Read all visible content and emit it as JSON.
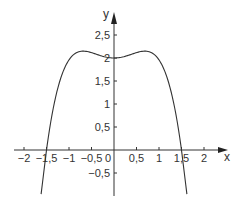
{
  "chart_data": {
    "type": "line",
    "title": "",
    "xlabel": "x",
    "ylabel": "y",
    "xlim": [
      -2.45,
      2.5
    ],
    "ylim": [
      -1.0,
      3.0
    ],
    "grid": false,
    "legend": "none",
    "origin_label": "0",
    "x_ticks": [
      {
        "value": -2,
        "label": "−2"
      },
      {
        "value": -1.5,
        "label": "−1,5"
      },
      {
        "value": -1,
        "label": "−1"
      },
      {
        "value": -0.5,
        "label": "−0,5"
      },
      {
        "value": 0.5,
        "label": "0,5"
      },
      {
        "value": 1,
        "label": "1"
      },
      {
        "value": 1.5,
        "label": "1,5"
      },
      {
        "value": 2,
        "label": "2"
      }
    ],
    "y_ticks": [
      {
        "value": 2.5,
        "label": "2,5"
      },
      {
        "value": 2,
        "label": "2"
      },
      {
        "value": 1.5,
        "label": "1,5"
      },
      {
        "value": 1,
        "label": "1"
      },
      {
        "value": 0.5,
        "label": "0,5"
      },
      {
        "value": -0.5,
        "label": "−0,5"
      }
    ],
    "series": [
      {
        "name": "f(x)",
        "description": "quartic curve, local minimum at (0, 2), maxima near (±0.69, 2.15), roots at ±1.5",
        "x_domain": [
          -1.62,
          1.62
        ],
        "x": [
          -1.62,
          -1.5,
          -1.4,
          -1.3,
          -1.2,
          -1.1,
          -1.0,
          -0.9,
          -0.8,
          -0.7,
          -0.6,
          -0.5,
          -0.4,
          -0.3,
          -0.2,
          -0.1,
          0,
          0.1,
          0.2,
          0.3,
          0.4,
          0.5,
          0.6,
          0.7,
          0.8,
          0.9,
          1.0,
          1.1,
          1.2,
          1.3,
          1.4,
          1.5,
          1.62
        ],
        "y": [
          -0.96,
          0.0,
          0.64,
          1.14,
          1.51,
          1.78,
          1.96,
          2.07,
          2.13,
          2.15,
          2.14,
          2.12,
          2.08,
          2.05,
          2.02,
          2.01,
          2.0,
          2.01,
          2.02,
          2.05,
          2.08,
          2.12,
          2.14,
          2.15,
          2.13,
          2.07,
          1.96,
          1.78,
          1.51,
          1.14,
          0.64,
          0.0,
          -0.96
        ],
        "color": "#333333"
      }
    ]
  }
}
